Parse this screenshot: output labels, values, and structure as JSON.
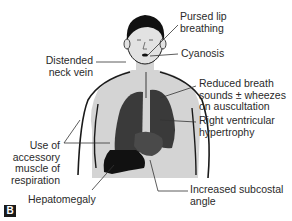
{
  "figure": {
    "panel_label": "B",
    "labels": {
      "pursed_lip": [
        "Pursed lip",
        "breathing"
      ],
      "cyanosis": [
        "Cyanosis"
      ],
      "neck_vein": [
        "Distended",
        "neck vein"
      ],
      "breath_sounds": [
        "Reduced breath",
        "sounds ± wheezes",
        "on auscultation"
      ],
      "rvh": [
        "Right ventricular",
        "hypertrophy"
      ],
      "accessory": [
        "Use of",
        "accessory",
        "muscle of",
        "respiration"
      ],
      "hepatomegaly": [
        "Hepatomegaly"
      ],
      "subcostal": [
        "Increased subcostal",
        "angle"
      ]
    },
    "colors": {
      "skin": "#d4d4d4",
      "outline": "#1a1a1a",
      "lungs": "#3a3a3a",
      "liver": "#111111",
      "heart": "#4a4a4a",
      "leader": "#333333"
    }
  }
}
